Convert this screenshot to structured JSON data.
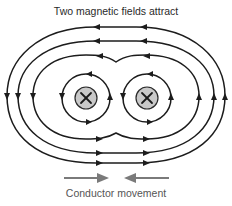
{
  "diagram": {
    "title": "Two magnetic fields attract",
    "caption": "Conductor movement",
    "conductors": [
      {
        "label": "left-conductor",
        "symbol": "×",
        "current_direction": "into-page"
      },
      {
        "label": "right-conductor",
        "symbol": "×",
        "current_direction": "into-page"
      }
    ],
    "field_lines": {
      "outer_loops": 3,
      "inner_loops_per_conductor": 1,
      "outer_direction": "counterclockwise",
      "inner_direction": "clockwise"
    },
    "movement_arrows": [
      {
        "direction": "right",
        "position": "left"
      },
      {
        "direction": "left",
        "position": "right"
      }
    ],
    "colors": {
      "line": "#1c1c1c",
      "conductor_fill": "#c9c9c9",
      "movement_arrow": "#7a7a7a",
      "text": "#2a2a2a"
    }
  }
}
